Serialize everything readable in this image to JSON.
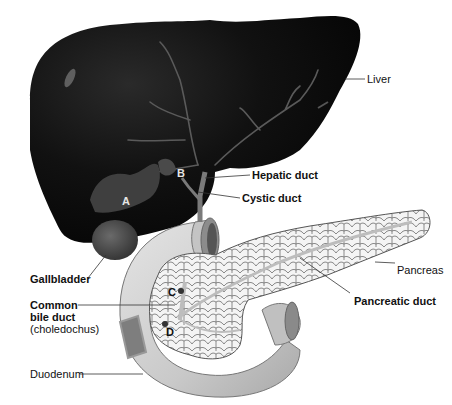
{
  "diagram": {
    "labels": {
      "liver": "Liver",
      "hepatic_duct": "Hepatic duct",
      "cystic_duct": "Cystic duct",
      "gallbladder": "Gallbladder",
      "common_bile_duct_1": "Common",
      "common_bile_duct_2": "bile duct",
      "common_bile_duct_3": "(choledochus)",
      "pancreas": "Pancreas",
      "pancreatic_duct": "Pancreatic duct",
      "duodenum": "Duodenum"
    },
    "markers": {
      "a": "A",
      "b": "B",
      "c": "C",
      "d": "D"
    },
    "colors": {
      "liver": "#0d0d0d",
      "liver_vessels": "#5a5a5a",
      "gallbladder": "#3c3c3c",
      "duodenum": "#c8c8c8",
      "pancreas": "#f2f2f2",
      "leader_lines": "#333333"
    }
  }
}
